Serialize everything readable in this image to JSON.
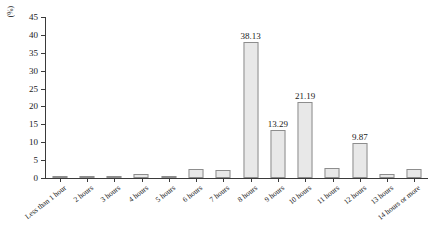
{
  "chart_data": {
    "type": "bar",
    "title": "",
    "xlabel": "",
    "ylabel": "(%)",
    "ylim": [
      0,
      45
    ],
    "ytick_step": 5,
    "yticks": [
      0,
      5,
      10,
      15,
      20,
      25,
      30,
      35,
      40,
      45
    ],
    "grid": false,
    "legend": "none",
    "bar_fill_color": "#e8e8e8",
    "bar_border_color": "#8d8d8d",
    "axis_color": "#3a3a3a",
    "categories": [
      "Less than 1 hour",
      "2 hours",
      "3 hours",
      "4 hours",
      "5 hours",
      "6 hours",
      "7 hours",
      "8 hours",
      "9 hours",
      "10 hours",
      "11 hours",
      "12 hours",
      "13 hours",
      "14 hours or more"
    ],
    "values": [
      0.2,
      0.25,
      0.6,
      1.1,
      0.45,
      2.6,
      2.3,
      38.13,
      13.29,
      21.19,
      2.8,
      9.87,
      1.1,
      2.6
    ],
    "data_labels": [
      "",
      "",
      "",
      "",
      "",
      "",
      "",
      "38.13",
      "13.29",
      "21.19",
      "",
      "9.87",
      "",
      ""
    ]
  }
}
